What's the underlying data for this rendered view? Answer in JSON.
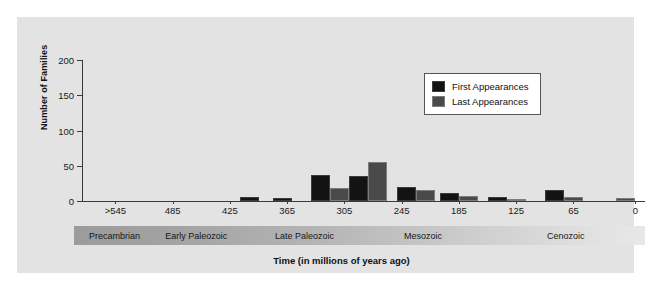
{
  "chart_data": {
    "type": "bar",
    "title": "",
    "xlabel": "Time (in millions of years ago)",
    "ylabel": "Number of Families",
    "ylim": [
      0,
      200
    ],
    "yticks": [
      0,
      50,
      100,
      150,
      200
    ],
    "xtick_labels": [
      ">545",
      "485",
      "425",
      "365",
      "305",
      "245",
      "185",
      "125",
      "65",
      "0"
    ],
    "xtick_values": [
      545,
      485,
      425,
      365,
      305,
      245,
      185,
      125,
      65,
      0
    ],
    "grid": false,
    "legend_position": "upper right",
    "series": [
      {
        "name": "First Appearances",
        "color": "#131313",
        "values": [
          0,
          0,
          0,
          0,
          5,
          4,
          37,
          35,
          20,
          12,
          6,
          16,
          0
        ]
      },
      {
        "name": "Last Appearances",
        "color": "#4a4a4a",
        "values": [
          0,
          0,
          0,
          0,
          0,
          0,
          18,
          55,
          16,
          7,
          2,
          6,
          4
        ]
      }
    ],
    "group_centers": [
      560,
      515,
      470,
      425,
      395,
      360,
      320,
      280,
      230,
      185,
      135,
      75,
      20
    ],
    "eras": [
      {
        "label": "Precambrian",
        "start": 580,
        "end": 500
      },
      {
        "label": "Early Paleozoic",
        "start": 500,
        "end": 385
      },
      {
        "label": "Late Paleozoic",
        "start": 385,
        "end": 250
      },
      {
        "label": "Mesozoic",
        "start": 250,
        "end": 100
      },
      {
        "label": "Cenozoic",
        "start": 100,
        "end": -10
      }
    ]
  },
  "legend": {
    "items": [
      {
        "label": "First Appearances",
        "key": "first"
      },
      {
        "label": "Last Appearances",
        "key": "last"
      }
    ]
  },
  "axes": {
    "y_title": "Number of Families",
    "x_title": "Time (in millions of years ago)"
  },
  "colors": {
    "panel_background": "#e3e3e3",
    "figure_background": "#ffffff",
    "axis": "#3a3a3a",
    "first_appearances": "#131313",
    "last_appearances": "#4a4a4a"
  }
}
